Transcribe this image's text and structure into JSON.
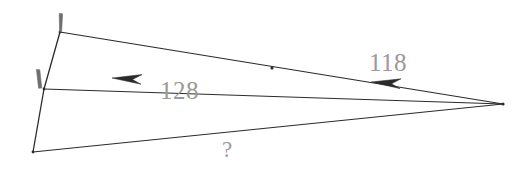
{
  "figure": {
    "background_color": "#ffffff",
    "stroke_color": "#2b2b2b",
    "tick_color": "#6e6e6e",
    "label_color": "#9a9a9a",
    "labels": {
      "side_upper": "118",
      "side_middle": "128",
      "side_lower": "?"
    },
    "vertices": {
      "top": {
        "name": "A",
        "x": 60,
        "y": 32
      },
      "middle": {
        "name": "B",
        "x": 44,
        "y": 89
      },
      "bottom_left": {
        "name": "C",
        "x": 33,
        "y": 152
      },
      "right_apex": {
        "name": "D",
        "x": 503,
        "y": 104
      }
    },
    "segments": [
      {
        "name": "top-to-middle",
        "from": "A",
        "to": "B",
        "tick_marks": 1
      },
      {
        "name": "middle-to-bottom",
        "from": "B",
        "to": "C",
        "tick_marks": 0
      },
      {
        "name": "top-to-apex",
        "from": "A",
        "to": "D",
        "label": "118",
        "arrow": "toward-left"
      },
      {
        "name": "middle-to-apex",
        "from": "B",
        "to": "D",
        "label": "128",
        "arrow": "toward-left"
      },
      {
        "name": "bottom-to-apex",
        "from": "C",
        "to": "D",
        "label": "?",
        "arrow": "none"
      }
    ],
    "tick_marks": [
      {
        "name": "tick-at-top-vertex",
        "x": 60,
        "y": 18
      },
      {
        "name": "tick-at-middle-vertex",
        "x": 40,
        "y": 74
      }
    ],
    "arrowheads": [
      {
        "name": "arrowhead-on-128-line",
        "x": 128,
        "y": 79,
        "direction": "left"
      },
      {
        "name": "arrowhead-on-118-line",
        "x": 387,
        "y": 84,
        "direction": "left"
      }
    ]
  }
}
